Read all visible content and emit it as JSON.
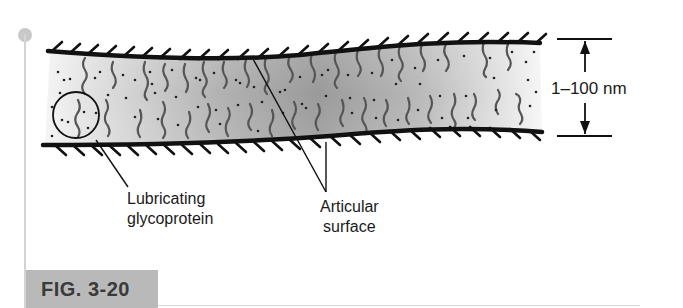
{
  "figure": {
    "number_label": "FIG. 3-20"
  },
  "labels": {
    "lubricating_line1": "Lubricating",
    "lubricating_line2": "glycoprotein",
    "articular_line1": "Articular",
    "articular_line2": "surface",
    "dimension": "1–100 nm"
  },
  "colors": {
    "fill_dark": "#8f8f8f",
    "fill_light": "#f2f2f2",
    "surface_line": "#111111",
    "chain": "#555555",
    "badge_bg": "#b9b9b9",
    "badge_text": "#3a3a3a"
  }
}
